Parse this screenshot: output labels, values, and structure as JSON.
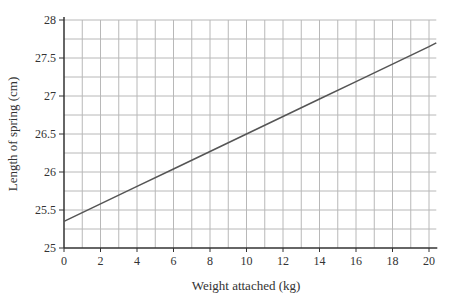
{
  "chart_data": {
    "type": "line",
    "title": "",
    "xlabel": "Weight attached (kg)",
    "ylabel": "Length of spring (cm)",
    "xlim": [
      0,
      20.4
    ],
    "ylim": [
      25,
      28
    ],
    "x_ticks": [
      0,
      2,
      4,
      6,
      8,
      10,
      12,
      14,
      16,
      18,
      20
    ],
    "x_tick_labels": [
      "0",
      "2",
      "4",
      "6",
      "8",
      "10",
      "12",
      "14",
      "16",
      "18",
      "20"
    ],
    "y_ticks": [
      25,
      25.5,
      26,
      26.5,
      27,
      27.5,
      28
    ],
    "y_tick_labels": [
      "25",
      "25.5",
      "26",
      "26.5",
      "27",
      "27.5",
      "28"
    ],
    "grid": true,
    "minor_grid": {
      "x_step": 1,
      "y_step": 0.25
    },
    "legend": null,
    "series": [
      {
        "name": "Length of spring",
        "x": [
          0,
          2,
          4,
          6,
          8,
          10,
          12,
          14,
          16,
          18,
          20,
          20.4
        ],
        "values": [
          25.35,
          25.58,
          25.81,
          26.04,
          26.27,
          26.5,
          26.73,
          26.96,
          27.19,
          27.42,
          27.65,
          27.7
        ]
      }
    ]
  },
  "colors": {
    "line": "#555555",
    "grid": "#b8b8b8",
    "axis": "#333333",
    "text": "#333333"
  }
}
